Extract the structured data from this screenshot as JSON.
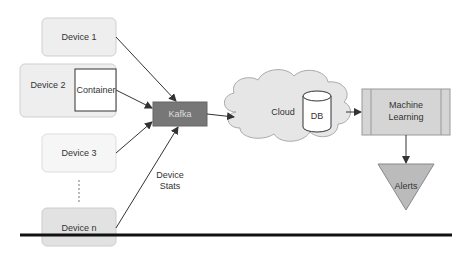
{
  "diagram": {
    "devices": [
      {
        "label": "Device 1"
      },
      {
        "label": "Device 2",
        "inner": "Container"
      },
      {
        "label": "Device 3"
      },
      {
        "label": "Device n"
      }
    ],
    "broker": {
      "label": "Kafka"
    },
    "edge_label": {
      "line1": "Device",
      "line2": "Stats"
    },
    "cloud": {
      "label": "Cloud"
    },
    "db": {
      "label": "DB"
    },
    "ml": {
      "line1": "Machine",
      "line2": "Learning"
    },
    "alerts": {
      "label": "Alerts"
    },
    "colors": {
      "device_fill": "#eeeeee",
      "device_border": "#cccccc",
      "broker_fill": "#777777",
      "cloud_fill": "#e6e6e6",
      "ml_fill": "#d5d5d5",
      "alerts_fill": "#bbbbbb",
      "arrow": "#333333",
      "rule": "#111111"
    }
  }
}
